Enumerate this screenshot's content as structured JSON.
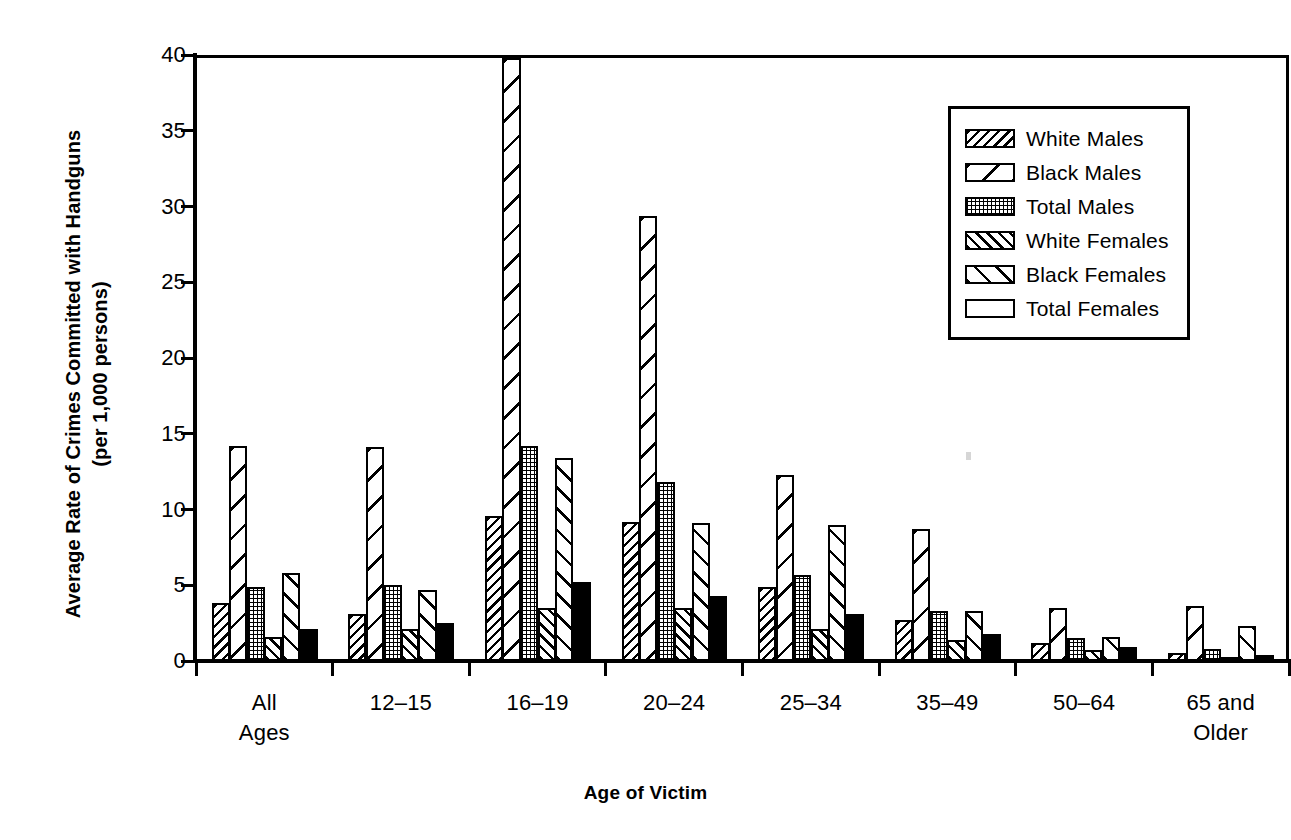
{
  "chart_data": {
    "type": "bar",
    "title": "",
    "xlabel": "Age of Victim",
    "ylabel": "Average Rate of Crimes Committed with Handguns (per 1,000 persons)",
    "ylabel_line1": "Average Rate of Crimes Committed with Handguns",
    "ylabel_line2": "(per 1,000 persons)",
    "ylim": [
      0,
      40
    ],
    "yticks": [
      0,
      5,
      10,
      15,
      20,
      25,
      30,
      35,
      40
    ],
    "ytick_labels": [
      "0",
      "5",
      "10",
      "15",
      "20",
      "25",
      "30",
      "35",
      "40"
    ],
    "grid": false,
    "legend_position": "top-right",
    "categories": [
      "All\nAges",
      "12–15",
      "16–19",
      "20–24",
      "25–34",
      "35–49",
      "50–64",
      "65 and\nOlder"
    ],
    "category_labels_flat": [
      "All Ages",
      "12–15",
      "16–19",
      "20–24",
      "25–34",
      "35–49",
      "50–64",
      "65 and Older"
    ],
    "series": [
      {
        "name": "White Males",
        "pattern": "dense-backslash-hatch",
        "pattern_class": "pat-wm",
        "values": [
          3.8,
          3.1,
          9.6,
          9.2,
          4.9,
          2.7,
          1.2,
          0.5
        ]
      },
      {
        "name": "Black Males",
        "pattern": "sparse-backslash-hatch",
        "pattern_class": "pat-bm",
        "values": [
          14.2,
          14.1,
          39.8,
          29.4,
          12.3,
          8.7,
          3.5,
          3.6
        ]
      },
      {
        "name": "Total Males",
        "pattern": "dotted-crosshatch",
        "pattern_class": "pat-tm",
        "values": [
          4.9,
          5.0,
          14.2,
          11.8,
          5.7,
          3.3,
          1.5,
          0.8
        ]
      },
      {
        "name": "White Females",
        "pattern": "dense-forward-hatch",
        "pattern_class": "pat-wf",
        "values": [
          1.6,
          2.1,
          3.5,
          3.5,
          2.1,
          1.4,
          0.7,
          0.25
        ]
      },
      {
        "name": "Black Females",
        "pattern": "medium-forward-hatch",
        "pattern_class": "pat-bf",
        "values": [
          5.8,
          4.7,
          13.4,
          9.1,
          9.0,
          3.3,
          1.6,
          2.3
        ]
      },
      {
        "name": "Total Females",
        "pattern": "solid-black",
        "pattern_class": "pat-tf",
        "values": [
          2.1,
          2.5,
          5.2,
          4.3,
          3.1,
          1.8,
          0.9,
          0.4
        ]
      }
    ],
    "colors": {
      "ink": "#000000",
      "background": "#ffffff"
    }
  }
}
